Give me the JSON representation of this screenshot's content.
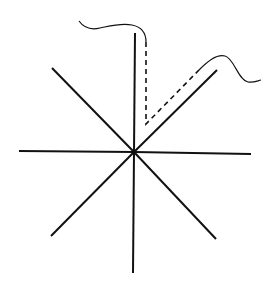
{
  "diagram": {
    "background": "#ffffff",
    "stroke_color": "#111111",
    "center": [
      134,
      152
    ],
    "rays": [
      {
        "name": "north",
        "x2": 135,
        "y2": 33
      },
      {
        "name": "south",
        "x2": 133,
        "y2": 273
      },
      {
        "name": "west",
        "x2": 19,
        "y2": 151
      },
      {
        "name": "east",
        "x2": 251,
        "y2": 154
      },
      {
        "name": "north-west",
        "x2": 52,
        "y2": 68
      },
      {
        "name": "north-east",
        "x2": 217,
        "y2": 70
      },
      {
        "name": "south-west",
        "x2": 51,
        "y2": 236
      },
      {
        "name": "south-east",
        "x2": 216,
        "y2": 239
      }
    ],
    "dashed_path": "M146,42 L146,124 L199,70",
    "wave_left": "M79,21 C84,28 92,30 100,28 C110,26 120,23 132,25 C142,27 146,34 146,42",
    "wave_right": "M199,70 C207,62 216,54 225,56 C234,58 238,80 248,82 C253,83 257,81 261,80"
  }
}
